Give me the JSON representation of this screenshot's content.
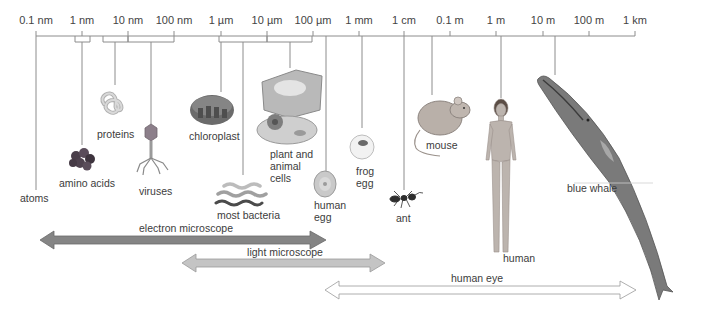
{
  "scale": {
    "ticks": [
      {
        "label": "0.1 nm",
        "x": 36
      },
      {
        "label": "1 nm",
        "x": 82
      },
      {
        "label": "10 nm",
        "x": 128
      },
      {
        "label": "100 nm",
        "x": 174
      },
      {
        "label": "1 µm",
        "x": 221
      },
      {
        "label": "10 µm",
        "x": 267
      },
      {
        "label": "100 µm",
        "x": 313
      },
      {
        "label": "1 mm",
        "x": 359
      },
      {
        "label": "1 cm",
        "x": 404
      },
      {
        "label": "0.1 m",
        "x": 450
      },
      {
        "label": "1 m",
        "x": 496
      },
      {
        "label": "10 m",
        "x": 543
      },
      {
        "label": "100 m",
        "x": 589
      },
      {
        "label": "1 km",
        "x": 635
      }
    ],
    "axis_y": 36
  },
  "objects": [
    {
      "id": "atoms",
      "label": "atoms"
    },
    {
      "id": "amino-acids",
      "label": "amino acids"
    },
    {
      "id": "proteins",
      "label": "proteins"
    },
    {
      "id": "viruses",
      "label": "viruses"
    },
    {
      "id": "chloroplast",
      "label": "chloroplast"
    },
    {
      "id": "most-bacteria",
      "label": "most bacteria"
    },
    {
      "id": "plant-animal-cells",
      "label": "plant and\nanimal\ncells"
    },
    {
      "id": "human-egg",
      "label": "human\negg"
    },
    {
      "id": "frog-egg",
      "label": "frog\negg"
    },
    {
      "id": "ant",
      "label": "ant"
    },
    {
      "id": "mouse",
      "label": "mouse"
    },
    {
      "id": "human",
      "label": "human"
    },
    {
      "id": "blue-whale",
      "label": "blue whale"
    }
  ],
  "ranges": [
    {
      "id": "electron-microscope",
      "label": "electron microscope",
      "from": "0.1 nm",
      "to": "100 µm",
      "color": "#8a8a8a"
    },
    {
      "id": "light-microscope",
      "label": "light microscope",
      "from": "100 nm",
      "to": "1 cm",
      "color": "#bdbdbd"
    },
    {
      "id": "human-eye",
      "label": "human eye",
      "from": "100 µm",
      "to": "1 km",
      "color": "#ffffff"
    }
  ],
  "colors": {
    "axis": "#888888",
    "text": "#3c3c3c"
  }
}
